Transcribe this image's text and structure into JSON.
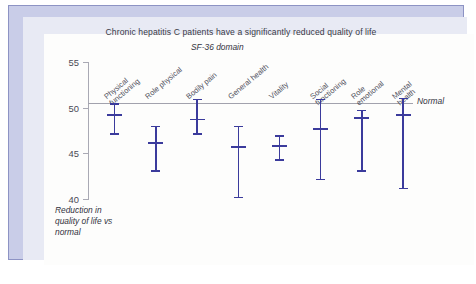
{
  "figure": {
    "title": "Chronic hepatitis C patients have a significantly reduced quality of life",
    "axis_title": "SF-36 domain",
    "reference_label": "Normal",
    "y_caption_line1": "Reduction in",
    "y_caption_line2": "quality of life vs",
    "y_caption_line3": "normal"
  },
  "chart_data": {
    "type": "scatter",
    "title": "Chronic hepatitis C patients have a significantly reduced quality of life",
    "xlabel": "SF-36 domain",
    "ylabel": "Reduction in quality of life vs normal",
    "ylim": [
      40,
      55
    ],
    "yticks": [
      40,
      45,
      50,
      55
    ],
    "ytick_labels": [
      "40",
      "45",
      "50",
      "55"
    ],
    "grid": false,
    "legend": "none",
    "annotations": [
      {
        "text": "Normal",
        "y": 50,
        "type": "reference-line"
      }
    ],
    "categories": [
      "Physical functioning",
      "Role physical",
      "Bodily pain",
      "General health",
      "Vitality",
      "Social functioning",
      "Role emotional",
      "Mental health"
    ],
    "category_label_lines": [
      [
        "Physical",
        "functioning"
      ],
      [
        "Role physical"
      ],
      [
        "Bodily pain"
      ],
      [
        "General health"
      ],
      [
        "Vitality"
      ],
      [
        "Social",
        "functioning"
      ],
      [
        "Role",
        "emotional"
      ],
      [
        "Mental",
        "health"
      ]
    ],
    "series": [
      {
        "name": "Mean score with 95% CI",
        "color": "#3b3b9c",
        "points": [
          {
            "category": "Physical functioning",
            "mean": 49.2,
            "upper": 50.5,
            "lower": 47.1
          },
          {
            "category": "Role physical",
            "mean": 46.1,
            "upper": 48.0,
            "lower": 43.0
          },
          {
            "category": "Bodily pain",
            "mean": 48.7,
            "upper": 51.0,
            "lower": 47.1
          },
          {
            "category": "General health",
            "mean": 45.7,
            "upper": 48.0,
            "lower": 40.1
          },
          {
            "category": "Vitality",
            "mean": 45.8,
            "upper": 47.0,
            "lower": 44.2
          },
          {
            "category": "Social functioning",
            "mean": 47.7,
            "upper": 51.0,
            "lower": 42.1
          },
          {
            "category": "Role emotional",
            "mean": 48.9,
            "upper": 49.8,
            "lower": 43.0
          },
          {
            "category": "Mental health",
            "mean": 49.2,
            "upper": 51.1,
            "lower": 41.1
          }
        ]
      }
    ]
  }
}
